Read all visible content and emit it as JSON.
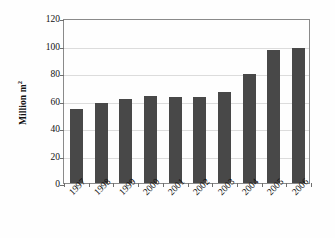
{
  "chart_data": {
    "type": "bar",
    "title": "",
    "subtitle": "",
    "xlabel": "",
    "ylabel": "Million m",
    "ylabel_superscript": "2",
    "ylabel_full": "Million m 2",
    "categories": [
      "1997",
      "1998",
      "1999",
      "2000",
      "2001",
      "2002",
      "2003",
      "2004",
      "2005",
      "2006"
    ],
    "values": [
      54,
      58.5,
      61,
      63,
      62.5,
      62.5,
      66,
      79.5,
      96.5,
      98.5
    ],
    "series": [
      {
        "name": "Million m 2",
        "values": [
          54,
          58.5,
          61,
          63,
          62.5,
          62.5,
          66,
          79.5,
          96.5,
          98.5
        ]
      }
    ],
    "ylim": [
      0,
      120
    ],
    "yticks": [
      "0",
      "20",
      "40",
      "60",
      "80",
      "100",
      "120"
    ],
    "ytick_values": [
      0,
      20,
      40,
      60,
      80,
      100,
      120
    ],
    "grid": true,
    "grid_axis": "y",
    "legend": false,
    "legend_position": "none",
    "bar_color": "#484848",
    "grid_color": "#dcdcdc",
    "frame_color": "#8a8a8a",
    "background_color": "#fefefe",
    "xtick_rotation": "-45"
  }
}
